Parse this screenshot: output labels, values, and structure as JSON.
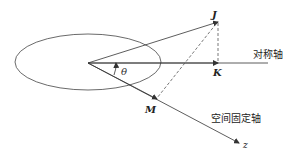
{
  "diagram": {
    "labels": {
      "J": "J",
      "K": "K",
      "M": "M",
      "z": "z",
      "theta": "θ",
      "symmetry_axis": "对称轴",
      "space_fixed_axis": "空间固定轴"
    },
    "elements": [
      "ellipse",
      "vector J",
      "symmetry axis with projection K",
      "space-fixed z axis with projection M",
      "dashed projection lines J→K and J→M",
      "angle θ between symmetry axis and z axis"
    ],
    "colors": {
      "line": "#333333",
      "background": "#ffffff"
    }
  }
}
